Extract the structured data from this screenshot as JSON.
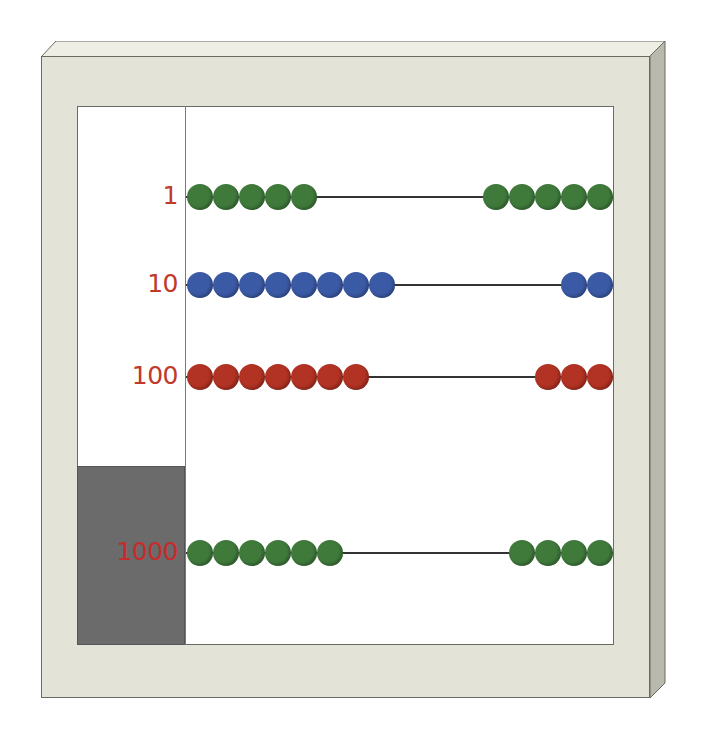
{
  "abacus": {
    "frame_color": "#e3e3d7",
    "label_color": "#c0392b",
    "rows": [
      {
        "label": "1",
        "left_beads": 5,
        "right_beads": 5,
        "color": "#3f7a3b",
        "y": 197
      },
      {
        "label": "10",
        "left_beads": 8,
        "right_beads": 2,
        "color": "#3b5aa6",
        "y": 285
      },
      {
        "label": "100",
        "left_beads": 7,
        "right_beads": 3,
        "color": "#b23223",
        "y": 377
      },
      {
        "label": "1000",
        "left_beads": 6,
        "right_beads": 4,
        "color": "#3f7a3b",
        "y": 553
      }
    ]
  }
}
